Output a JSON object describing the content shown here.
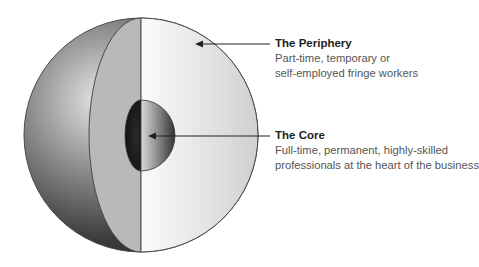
{
  "diagram": {
    "type": "core-periphery-sphere",
    "labels": [
      {
        "id": "periphery",
        "title": "The Periphery",
        "description_lines": [
          "Part-time, temporary or",
          "self-employed fringe workers"
        ]
      },
      {
        "id": "core",
        "title": "The Core",
        "description_lines": [
          "Full-time, permanent, highly-skilled",
          "professionals at the heart of the business"
        ]
      }
    ],
    "colors": {
      "background": "#ffffff",
      "outline": "#4a4a4a",
      "arrow": "#222222",
      "title_text": "#222222",
      "desc_text": "#555555"
    }
  }
}
